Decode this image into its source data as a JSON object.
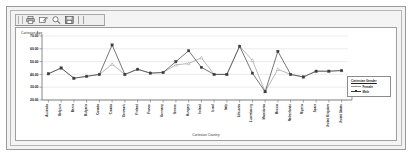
{
  "window": {
    "title": ""
  },
  "toolbar": {
    "buttons": [
      {
        "name": "print-icon",
        "label": "Print"
      },
      {
        "name": "edit-icon",
        "label": "Edit"
      },
      {
        "name": "zoom-icon",
        "label": "Zoom"
      },
      {
        "name": "save-icon",
        "label": "Save"
      }
    ],
    "separator_label": "|"
  },
  "legend": {
    "title": "Cartesian Gender",
    "entries": [
      {
        "label": "Female",
        "color": "#9a9a9a",
        "marker": "triangle"
      },
      {
        "label": "Male",
        "color": "#3b3b3b",
        "marker": "square"
      }
    ]
  },
  "chart_data": {
    "type": "line",
    "title": "",
    "xlabel": "Cartesian Country",
    "ylabel": "Cartesian Age",
    "ylim": [
      20,
      70
    ],
    "yticks": [
      "20.00",
      "30.00",
      "40.00",
      "50.00",
      "60.00",
      "70.00"
    ],
    "grid": true,
    "legend_position": "right",
    "categories": [
      "Australia",
      "Belgium",
      "Benin",
      "Bulgaria",
      "Canada",
      "Croatia",
      "Denmark",
      "Finland",
      "France",
      "Germany",
      "Greece",
      "Hungary",
      "Ireland",
      "Israel",
      "Italy",
      "Lithuania",
      "Luxembourg",
      "Macedonia",
      "Mexico",
      "Netherlands",
      "Nigeria",
      "Spain",
      "United Kingdom",
      "United States"
    ],
    "series": [
      {
        "name": "Female",
        "color": "#9a9a9a",
        "marker": "triangle",
        "values": [
          40.5,
          45.0,
          37.0,
          38.5,
          40.0,
          48.0,
          40.0,
          44.0,
          41.0,
          41.5,
          47.5,
          48.5,
          53.0,
          40.0,
          40.0,
          62.0,
          51.0,
          26.5,
          44.0,
          40.0,
          38.0,
          42.5,
          42.5,
          43.0
        ]
      },
      {
        "name": "Male",
        "color": "#3b3b3b",
        "marker": "square",
        "values": [
          40.5,
          45.0,
          37.0,
          38.5,
          40.0,
          63.0,
          40.0,
          44.0,
          41.0,
          41.5,
          50.0,
          58.5,
          45.5,
          40.0,
          40.0,
          62.0,
          41.0,
          26.5,
          58.0,
          40.0,
          38.0,
          42.5,
          42.5,
          43.0
        ]
      }
    ]
  }
}
